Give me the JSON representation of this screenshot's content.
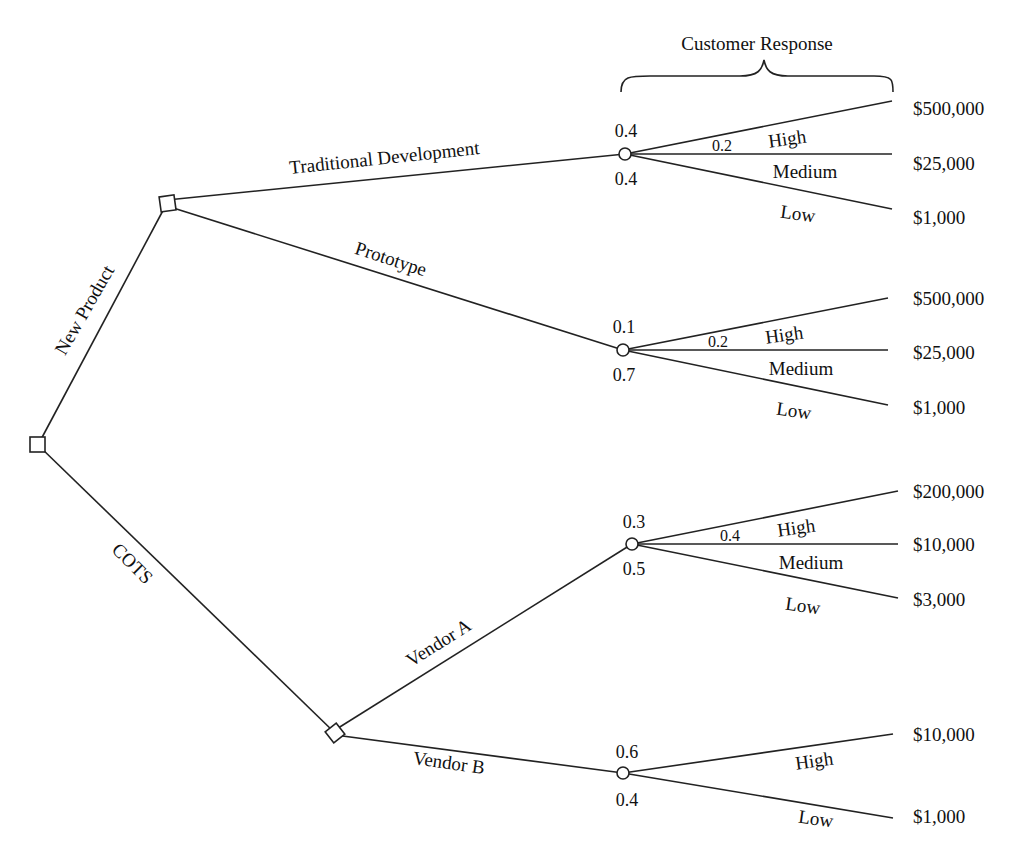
{
  "title": "Customer Response",
  "root": {
    "label": "",
    "type": "decision"
  },
  "branches": {
    "new_product": "New Product",
    "cots": "COTS",
    "traditional": "Traditional Development",
    "prototype": "Prototype",
    "vendor_a": "Vendor A",
    "vendor_b": "Vendor B"
  },
  "outcomes": {
    "high": "High",
    "medium": "Medium",
    "low": "Low"
  },
  "traditional": {
    "p_high": "0.4",
    "p_medium": "0.2",
    "p_low": "0.4",
    "pay_high": "$500,000",
    "pay_medium": "$25,000",
    "pay_low": "$1,000"
  },
  "prototype": {
    "p_high": "0.1",
    "p_medium": "0.2",
    "p_low": "0.7",
    "pay_high": "$500,000",
    "pay_medium": "$25,000",
    "pay_low": "$1,000"
  },
  "vendor_a": {
    "p_high": "0.3",
    "p_medium": "0.4",
    "p_low": "0.5",
    "pay_high": "$200,000",
    "pay_medium": "$10,000",
    "pay_low": "$3,000"
  },
  "vendor_b": {
    "p_high": "0.6",
    "p_low": "0.4",
    "pay_high": "$10,000",
    "pay_low": "$1,000"
  },
  "colors": {
    "line": "#222222",
    "background": "#ffffff"
  }
}
